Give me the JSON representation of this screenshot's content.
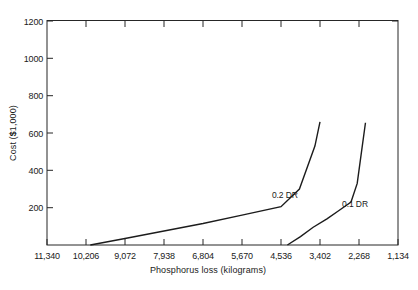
{
  "chart_data": {
    "type": "line",
    "title": "",
    "xlabel": "Phosphorus loss (kilograms)",
    "ylabel": "Cost ($1,000)",
    "ylabel_prefix": "Cost (",
    "ylabel_currency": "$",
    "ylabel_suffix": "1,000)",
    "grid": false,
    "legend_position": "inline-annotation",
    "x_axis_direction": "decreasing",
    "xlim": [
      11340,
      1134
    ],
    "ylim": [
      0,
      1200
    ],
    "x_tick_labels": [
      "11,340",
      "10,206",
      "9,072",
      "7,938",
      "6,804",
      "5,670",
      "4,536",
      "3,402",
      "2,268",
      "1,134"
    ],
    "x_tick_values": [
      11340,
      10206,
      9072,
      7938,
      6804,
      5670,
      4536,
      3402,
      2268,
      1134
    ],
    "y_tick_labels": [
      "1200",
      "1000",
      "800",
      "600",
      "400",
      "200"
    ],
    "y_tick_values": [
      1200,
      1000,
      800,
      600,
      400,
      200
    ],
    "series": [
      {
        "name": "0.2 DR",
        "label": "0.2 DR",
        "label_x": 4800,
        "label_y": 250,
        "x": [
          10080,
          9072,
          7938,
          6804,
          5670,
          4536,
          4000,
          3550,
          3402
        ],
        "y": [
          0,
          35,
          75,
          115,
          160,
          205,
          300,
          530,
          660
        ],
        "points": [
          {
            "x": 10080,
            "y": 0
          },
          {
            "x": 9072,
            "y": 35
          },
          {
            "x": 7938,
            "y": 75
          },
          {
            "x": 6804,
            "y": 115
          },
          {
            "x": 5670,
            "y": 160
          },
          {
            "x": 4536,
            "y": 205
          },
          {
            "x": 4000,
            "y": 300
          },
          {
            "x": 3550,
            "y": 530
          },
          {
            "x": 3402,
            "y": 660
          }
        ]
      },
      {
        "name": "0.1 DR",
        "label": "0.1 DR",
        "label_x": 2760,
        "label_y": 205,
        "x": [
          4350,
          3970,
          3600,
          3200,
          2850,
          2500,
          2320,
          2180,
          2080
        ],
        "y": [
          0,
          45,
          95,
          140,
          185,
          230,
          330,
          520,
          655
        ],
        "points": [
          {
            "x": 4350,
            "y": 0
          },
          {
            "x": 3970,
            "y": 45
          },
          {
            "x": 3600,
            "y": 95
          },
          {
            "x": 3200,
            "y": 140
          },
          {
            "x": 2850,
            "y": 185
          },
          {
            "x": 2500,
            "y": 230
          },
          {
            "x": 2320,
            "y": 330
          },
          {
            "x": 2180,
            "y": 520
          },
          {
            "x": 2080,
            "y": 655
          }
        ]
      }
    ],
    "colors": {
      "curve": "#1c1c1c",
      "axis": "#262626",
      "text": "#1a1a1a",
      "background": "#ffffff"
    }
  }
}
